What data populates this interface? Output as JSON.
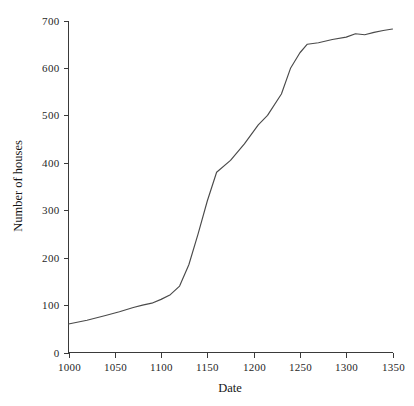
{
  "chart_data": {
    "type": "line",
    "title": "",
    "subtitle": "",
    "xlabel": "Date",
    "ylabel": "Number of houses",
    "xlim": [
      1000,
      1350
    ],
    "ylim": [
      0,
      700
    ],
    "grid": false,
    "legend": null,
    "x_ticks": [
      1000,
      1050,
      1100,
      1150,
      1200,
      1250,
      1300,
      1350
    ],
    "x_tick_labels": [
      "1000",
      "1050",
      "1100",
      "1150",
      "1200",
      "1250",
      "1300",
      "1350"
    ],
    "y_ticks": [
      0,
      100,
      200,
      300,
      400,
      500,
      600,
      700
    ],
    "y_tick_labels": [
      "0",
      "100",
      "200",
      "300",
      "400",
      "500",
      "600",
      "700"
    ],
    "series": [
      {
        "name": "Number of houses",
        "color": "#4a4a4a",
        "x": [
          1000,
          1020,
          1040,
          1055,
          1070,
          1080,
          1090,
          1100,
          1110,
          1120,
          1130,
          1140,
          1150,
          1160,
          1175,
          1190,
          1205,
          1215,
          1230,
          1240,
          1250,
          1258,
          1270,
          1285,
          1300,
          1310,
          1320,
          1330,
          1340,
          1350
        ],
        "y": [
          60,
          68,
          78,
          86,
          95,
          100,
          104,
          112,
          122,
          140,
          185,
          250,
          320,
          380,
          405,
          440,
          480,
          500,
          545,
          600,
          632,
          650,
          653,
          660,
          665,
          672,
          670,
          675,
          679,
          682
        ]
      }
    ],
    "annotations": []
  },
  "axes": {
    "y_axis_label": "Number of houses",
    "x_axis_label": "Date"
  }
}
